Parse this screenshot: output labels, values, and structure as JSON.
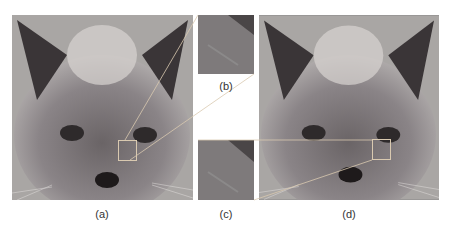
{
  "figure": {
    "panels": [
      {
        "id": "a",
        "label": "(a)",
        "content": "cat face photo with highlighted region"
      },
      {
        "id": "b",
        "label": "(b)",
        "content": "zoomed fur patch"
      },
      {
        "id": "c",
        "label": "(c)",
        "content": "zoomed fur patch"
      },
      {
        "id": "d",
        "label": "(d)",
        "content": "cat face photo with highlighted region"
      }
    ],
    "colors": {
      "highlight_box": "#d9c9b0",
      "connector_line": "#d9c9b0"
    }
  }
}
